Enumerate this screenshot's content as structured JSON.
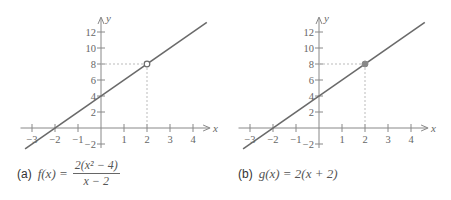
{
  "chart_data": [
    {
      "type": "line",
      "panel_label": "(a)",
      "title": "f(x) = 2(x^2 - 4)/(x - 2)",
      "caption": {
        "label": "(a)",
        "lhs": "f(x) =",
        "numerator": "2(x² − 4)",
        "denominator": "x − 2"
      },
      "xlabel": "x",
      "ylabel": "y",
      "xlim": [
        -3.3,
        4.6
      ],
      "ylim": [
        -2.5,
        13.5
      ],
      "x_ticks": [
        "-3",
        "-2",
        "-1",
        "1",
        "2",
        "3",
        "4"
      ],
      "y_ticks": [
        "-2",
        "2",
        "4",
        "6",
        "8",
        "10",
        "12"
      ],
      "series": [
        {
          "name": "f(x)",
          "x": [
            -3.3,
            4.6
          ],
          "y": [
            -2.6,
            13.2
          ]
        }
      ],
      "annotations": [
        {
          "type": "open_point",
          "x": 2,
          "y": 8,
          "note": "hole at (2, 8)"
        },
        {
          "type": "dashed_guides",
          "x": 2,
          "y": 8
        }
      ],
      "grid": false
    },
    {
      "type": "line",
      "panel_label": "(b)",
      "title": "g(x) = 2(x + 2)",
      "caption": {
        "label": "(b)",
        "lhs": "g(x) = 2(x + 2)"
      },
      "xlabel": "x",
      "ylabel": "y",
      "xlim": [
        -3.3,
        4.6
      ],
      "ylim": [
        -2.5,
        13.5
      ],
      "x_ticks": [
        "-3",
        "-2",
        "-1",
        "1",
        "2",
        "3",
        "4"
      ],
      "y_ticks": [
        "-2",
        "2",
        "4",
        "6",
        "8",
        "10",
        "12"
      ],
      "series": [
        {
          "name": "g(x)",
          "x": [
            -3.3,
            4.6
          ],
          "y": [
            -2.6,
            13.2
          ]
        }
      ],
      "annotations": [
        {
          "type": "filled_point",
          "x": 2,
          "y": 8
        },
        {
          "type": "dashed_guides",
          "x": 2,
          "y": 8
        }
      ],
      "grid": false
    }
  ],
  "captions": {
    "a_label": "(a)",
    "a_lhs": "f(x) =",
    "a_num": "2(x² − 4)",
    "a_den": "x − 2",
    "b_label": "(b)",
    "b_expr": "g(x) = 2(x + 2)"
  },
  "axes": {
    "x": "x",
    "y": "y"
  },
  "ticks": {
    "x": [
      "−3",
      "−2",
      "−1",
      "1",
      "2",
      "3",
      "4"
    ],
    "y": [
      "−2",
      "2",
      "4",
      "6",
      "8",
      "10",
      "12"
    ]
  },
  "colors": {
    "line": "#6a6a6a",
    "axis": "#888888",
    "guide": "#bbbbbb",
    "point": "#888888"
  }
}
